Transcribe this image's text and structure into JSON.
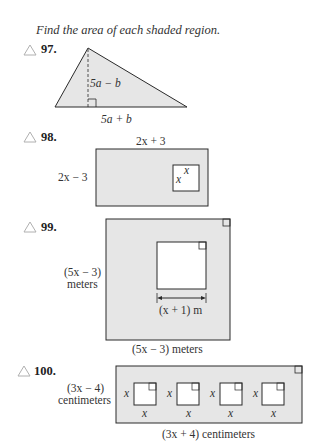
{
  "instruction": "Find the area of each shaded region.",
  "colors": {
    "shade": "#e6e6e6",
    "stroke": "#2a2a2a",
    "triangle_icon": "#b0b0b0"
  },
  "problems": [
    {
      "number": "97.",
      "shape": "triangle",
      "height_label": "5a − b",
      "base_label": "5a + b"
    },
    {
      "number": "98.",
      "shape": "rectangle with square cutout",
      "top_label": "2x + 3",
      "side_label": "2x − 3",
      "inner_labels": [
        "x",
        "x"
      ]
    },
    {
      "number": "99.",
      "shape": "square with square cutout",
      "side_label_line1": "(5x − 3)",
      "side_label_line2": "meters",
      "inner_label": "(x + 1) m",
      "bottom_label": "(5x − 3) meters"
    },
    {
      "number": "100.",
      "shape": "rectangle with four square cutouts",
      "side_label_line1": "(3x − 4)",
      "side_label_line2": "centimeters",
      "square_label": "x",
      "bottom_label": "(3x + 4) centimeters"
    }
  ]
}
